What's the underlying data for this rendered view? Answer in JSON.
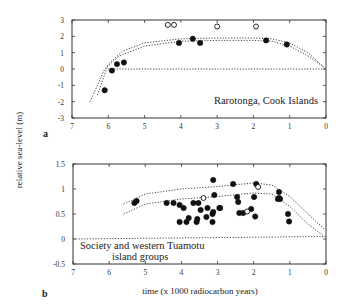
{
  "figure": {
    "ylabel": "relative sea-level (m)",
    "xlabel": "time (x 1000 radiocarbon years)"
  },
  "chart_data": [
    {
      "type": "scatter",
      "panel": "a",
      "title": "",
      "annotation": "Rarotonga, Cook Islands",
      "xlabel": "time (x 1000 radiocarbon years)",
      "ylabel": "relative sea-level (m)",
      "xlim": [
        7,
        0
      ],
      "ylim": [
        -3,
        3
      ],
      "xticks": [
        "7",
        "6",
        "5",
        "4",
        "3",
        "2",
        "1",
        "0"
      ],
      "yticks": [
        "3",
        "2",
        "1",
        "0",
        "-1",
        "-2",
        "-3"
      ],
      "grid": false,
      "series": [
        {
          "name": "filled",
          "marker": "filled-circle",
          "x": [
            6.1,
            5.9,
            5.76,
            5.57,
            4.05,
            3.67,
            3.47,
            1.65,
            1.08
          ],
          "y": [
            -1.3,
            -0.1,
            0.3,
            0.4,
            1.6,
            1.85,
            1.6,
            1.75,
            1.5
          ]
        },
        {
          "name": "open",
          "marker": "open-circle",
          "x": [
            4.36,
            4.19,
            3.0,
            1.93
          ],
          "y": [
            2.7,
            2.7,
            2.6,
            2.6
          ]
        },
        {
          "name": "envelope-upper",
          "line": "dotted",
          "x": [
            6.3,
            6.0,
            5.6,
            5.0,
            4.0,
            3.0,
            2.0,
            1.5,
            1.0,
            0.5,
            0.05
          ],
          "y": [
            -1.6,
            0.3,
            1.1,
            1.6,
            1.85,
            1.9,
            1.9,
            1.85,
            1.6,
            1.0,
            0.1
          ]
        },
        {
          "name": "envelope-lower",
          "line": "dotted",
          "x": [
            6.5,
            6.1,
            5.7,
            5.0,
            4.0,
            3.0,
            2.0,
            1.5,
            1.0,
            0.5,
            0.05
          ],
          "y": [
            -2.0,
            0.0,
            0.8,
            1.4,
            1.7,
            1.75,
            1.75,
            1.7,
            1.4,
            0.8,
            0.1
          ]
        },
        {
          "name": "zero-line",
          "line": "dotted",
          "x": [
            6.0,
            0
          ],
          "y": [
            0,
            0
          ]
        }
      ]
    },
    {
      "type": "scatter",
      "panel": "b",
      "title": "",
      "annotation": [
        "Society and western Tuamotu",
        "island groups"
      ],
      "xlabel": "time (x 1000 radiocarbon years)",
      "ylabel": "relative sea-level (m)",
      "xlim": [
        7,
        0
      ],
      "ylim": [
        -0.5,
        1.5
      ],
      "xticks": [
        "7",
        "6",
        "5",
        "4",
        "3",
        "2",
        "1",
        "0"
      ],
      "yticks": [
        "1.5",
        "1",
        "0.5",
        "0",
        "-0.5"
      ],
      "grid": false,
      "series": [
        {
          "name": "filled",
          "marker": "filled-circle",
          "x": [
            5.3,
            5.24,
            4.41,
            4.22,
            4.05,
            3.94,
            3.8,
            4.05,
            3.86,
            3.67,
            3.53,
            3.47,
            3.58,
            3.56,
            3.31,
            3.28,
            3.12,
            3.09,
            3.14,
            3.12,
            3.14,
            2.95,
            2.93,
            2.57,
            2.46,
            2.43,
            2.4,
            2.29,
            2.07,
            1.99,
            1.96,
            1.93,
            1.3,
            1.3,
            1.27,
            1.33,
            1.05,
            1.02
          ],
          "y": [
            0.72,
            0.76,
            0.72,
            0.72,
            0.68,
            0.62,
            0.42,
            0.34,
            0.34,
            0.72,
            0.72,
            0.58,
            0.34,
            0.4,
            0.44,
            0.62,
            1.18,
            0.88,
            0.5,
            0.54,
            0.34,
            0.62,
            0.62,
            1.1,
            0.84,
            0.74,
            0.52,
            0.52,
            0.6,
            0.84,
            0.45,
            1.1,
            0.94,
            0.82,
            0.8,
            0.8,
            0.5,
            0.35
          ]
        },
        {
          "name": "open",
          "marker": "open-circle",
          "x": [
            3.39,
            2.18,
            1.88
          ],
          "y": [
            0.82,
            0.55,
            1.04
          ]
        },
        {
          "name": "envelope-upper",
          "line": "dotted",
          "x": [
            5.6,
            5.0,
            4.0,
            3.0,
            2.0,
            1.5,
            1.0,
            0.5,
            0.05
          ],
          "y": [
            0.7,
            0.9,
            1.0,
            1.05,
            1.12,
            1.08,
            0.85,
            0.5,
            0.2
          ]
        },
        {
          "name": "envelope-lower",
          "line": "dotted",
          "x": [
            5.6,
            5.0,
            4.0,
            3.0,
            2.0,
            1.5,
            1.0,
            0.5,
            0.05
          ],
          "y": [
            0.5,
            0.7,
            0.8,
            0.85,
            0.92,
            0.9,
            0.65,
            0.3,
            0.05
          ]
        },
        {
          "name": "zero-line",
          "line": "dotted",
          "x": [
            7,
            0
          ],
          "y": [
            0,
            0.05
          ]
        }
      ]
    }
  ]
}
